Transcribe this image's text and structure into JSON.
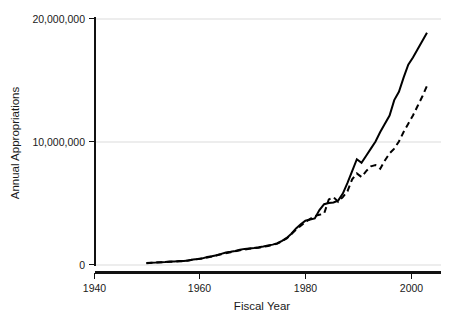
{
  "chart_data": {
    "type": "line",
    "title": "",
    "xlabel": "Fiscal Year",
    "ylabel": "Annual Appropriations",
    "xlim": [
      1935,
      2009
    ],
    "ylim": [
      0,
      20800000
    ],
    "xticks": [
      1940,
      1960,
      1980,
      2000
    ],
    "xtick_labels": [
      "1940",
      "1960",
      "1980",
      "2000"
    ],
    "yticks": [
      0,
      10000000,
      20000000
    ],
    "ytick_labels": [
      "0",
      "10,000,000",
      "20,000,000"
    ],
    "grid": "horizontal",
    "legend": "none",
    "series": [
      {
        "name": "solid-series",
        "style": "solid",
        "color": "#000000",
        "x": [
          1946,
          1947,
          1948,
          1949,
          1950,
          1951,
          1952,
          1953,
          1954,
          1955,
          1956,
          1957,
          1958,
          1959,
          1960,
          1961,
          1962,
          1963,
          1964,
          1965,
          1966,
          1967,
          1968,
          1969,
          1970,
          1971,
          1972,
          1973,
          1974,
          1975,
          1976,
          1977,
          1978,
          1979,
          1980,
          1981,
          1982,
          1983,
          1984,
          1985,
          1986,
          1987,
          1988,
          1989,
          1990,
          1991,
          1992,
          1993,
          1994,
          1995,
          1996,
          1997,
          1998,
          1999,
          2000,
          2001,
          2002,
          2003,
          2004,
          2005,
          2006
        ],
        "values": [
          120000,
          150000,
          170000,
          200000,
          220000,
          250000,
          260000,
          290000,
          300000,
          340000,
          430000,
          470000,
          520000,
          640000,
          700000,
          790000,
          900000,
          1020000,
          1080000,
          1150000,
          1250000,
          1320000,
          1360000,
          1400000,
          1450000,
          1520000,
          1600000,
          1680000,
          1800000,
          2000000,
          2250000,
          2600000,
          3050000,
          3400000,
          3700000,
          3800000,
          3900000,
          4600000,
          5100000,
          5200000,
          5250000,
          5400000,
          6000000,
          6900000,
          7900000,
          8900000,
          8600000,
          9200000,
          9800000,
          10400000,
          11200000,
          11900000,
          12600000,
          13900000,
          14600000,
          15800000,
          16900000,
          17500000,
          18200000,
          18900000,
          19600000
        ]
      },
      {
        "name": "dashed-series",
        "style": "dashed",
        "color": "#000000",
        "x": [
          1946,
          1948,
          1950,
          1952,
          1954,
          1956,
          1958,
          1960,
          1962,
          1964,
          1966,
          1968,
          1970,
          1972,
          1974,
          1976,
          1978,
          1980,
          1982,
          1983,
          1984,
          1985,
          1986,
          1987,
          1988,
          1989,
          1990,
          1991,
          1992,
          1993,
          1994,
          1995,
          1996,
          1997,
          1998,
          1999,
          2000,
          2001,
          2002,
          2003,
          2004,
          2005,
          2006
        ],
        "values": [
          110000,
          160000,
          210000,
          250000,
          290000,
          410000,
          500000,
          680000,
          870000,
          1040000,
          1210000,
          1330000,
          1420000,
          1570000,
          1760000,
          2200000,
          2950000,
          3600000,
          4100000,
          4200000,
          4300000,
          5500000,
          5700000,
          5300000,
          5700000,
          6200000,
          7200000,
          7700000,
          7400000,
          7900000,
          8300000,
          8400000,
          8100000,
          8800000,
          9400000,
          9800000,
          10400000,
          11200000,
          11900000,
          12600000,
          13400000,
          14200000,
          15100000
        ]
      }
    ]
  },
  "axes": {
    "ylabel": "Annual Appropriations",
    "xlabel": "Fiscal Year"
  }
}
